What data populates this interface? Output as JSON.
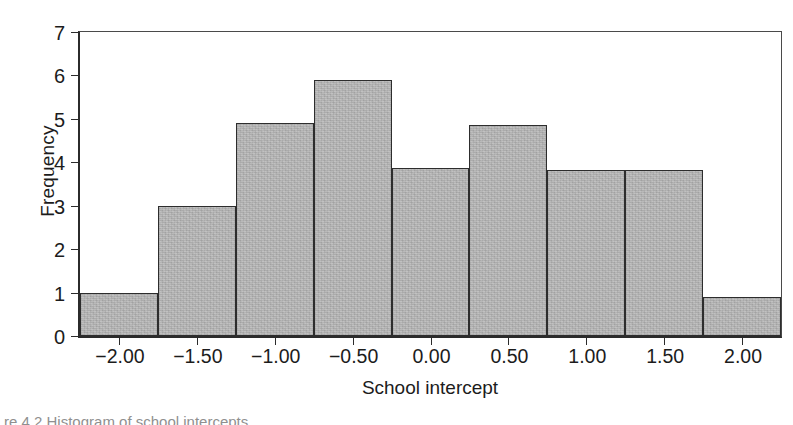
{
  "figure": {
    "caption": "re 4.2   Histogram of school intercepts",
    "background": "#ffffff"
  },
  "chart_data": {
    "type": "bar",
    "subtype": "histogram",
    "title": "",
    "xlabel": "School intercept",
    "ylabel": "Frequency",
    "xlim": [
      -2.25,
      2.25
    ],
    "ylim": [
      0,
      7
    ],
    "bin_width": 0.5,
    "grid": false,
    "legend": null,
    "bar_fill": "#b9b9b9",
    "bar_edge": "#2d2d2d",
    "axis_color": "#2b2b2b",
    "xticks": [
      -2.0,
      -1.5,
      -1.0,
      -0.5,
      0.0,
      0.5,
      1.0,
      1.5,
      2.0
    ],
    "xtick_labels": [
      "−2.00",
      "−1.50",
      "−1.00",
      "−0.50",
      "0.00",
      "0.50",
      "1.00",
      "1.50",
      "2.00"
    ],
    "yticks": [
      0,
      1,
      2,
      3,
      4,
      5,
      6,
      7
    ],
    "ytick_labels": [
      "0",
      "1",
      "2",
      "3",
      "4",
      "5",
      "6",
      "7"
    ],
    "bins": [
      {
        "left": -2.25,
        "right": -1.75,
        "center": -2.0,
        "value": 1.0
      },
      {
        "left": -1.75,
        "right": -1.25,
        "center": -1.5,
        "value": 3.0
      },
      {
        "left": -1.25,
        "right": -0.75,
        "center": -1.0,
        "value": 4.9
      },
      {
        "left": -0.75,
        "right": -0.25,
        "center": -0.5,
        "value": 5.9
      },
      {
        "left": -0.25,
        "right": 0.25,
        "center": 0.0,
        "value": 3.87
      },
      {
        "left": 0.25,
        "right": 0.75,
        "center": 0.5,
        "value": 4.85
      },
      {
        "left": 0.75,
        "right": 1.25,
        "center": 1.0,
        "value": 3.83
      },
      {
        "left": 1.25,
        "right": 1.75,
        "center": 1.5,
        "value": 3.83
      },
      {
        "left": 1.75,
        "right": 2.25,
        "center": 2.0,
        "value": 0.9
      }
    ],
    "categories": [
      "-2.00",
      "-1.50",
      "-1.00",
      "-0.50",
      "0.00",
      "0.50",
      "1.00",
      "1.50",
      "2.00"
    ],
    "values": [
      1.0,
      3.0,
      4.9,
      5.9,
      3.87,
      4.85,
      3.83,
      3.83,
      0.9
    ]
  }
}
